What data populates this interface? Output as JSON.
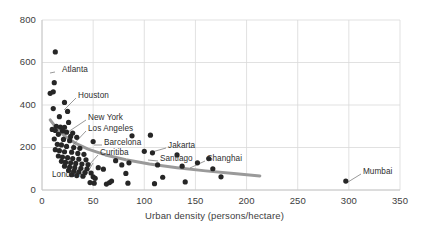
{
  "chart_data": {
    "type": "scatter",
    "title": "",
    "xlabel": "Urban density (persons/hectare)",
    "ylabel": "",
    "xlim": [
      0,
      350
    ],
    "ylim": [
      0,
      800
    ],
    "xticks": [
      0,
      50,
      100,
      150,
      200,
      250,
      300,
      350
    ],
    "yticks": [
      0,
      200,
      400,
      600,
      800
    ],
    "grid": true,
    "legend": "none",
    "marker_color": "#262626",
    "trend_color": "#9a9a9a",
    "grid_color": "#d9d9d9",
    "text_color": "#3d3d3d",
    "points": [
      {
        "x": 13,
        "y": 650
      },
      {
        "x": 12,
        "y": 505
      },
      {
        "x": 8,
        "y": 455
      },
      {
        "x": 11,
        "y": 462
      },
      {
        "x": 22,
        "y": 412
      },
      {
        "x": 11,
        "y": 383
      },
      {
        "x": 25,
        "y": 370
      },
      {
        "x": 17,
        "y": 345
      },
      {
        "x": 26,
        "y": 318
      },
      {
        "x": 14,
        "y": 300
      },
      {
        "x": 18,
        "y": 296
      },
      {
        "x": 22,
        "y": 295
      },
      {
        "x": 10,
        "y": 285
      },
      {
        "x": 13,
        "y": 280
      },
      {
        "x": 20,
        "y": 278
      },
      {
        "x": 24,
        "y": 272
      },
      {
        "x": 30,
        "y": 268
      },
      {
        "x": 16,
        "y": 262
      },
      {
        "x": 28,
        "y": 252
      },
      {
        "x": 34,
        "y": 248
      },
      {
        "x": 12,
        "y": 240
      },
      {
        "x": 21,
        "y": 238
      },
      {
        "x": 27,
        "y": 232
      },
      {
        "x": 88,
        "y": 255
      },
      {
        "x": 106,
        "y": 258
      },
      {
        "x": 50,
        "y": 228
      },
      {
        "x": 15,
        "y": 215
      },
      {
        "x": 19,
        "y": 212
      },
      {
        "x": 24,
        "y": 205
      },
      {
        "x": 31,
        "y": 200
      },
      {
        "x": 37,
        "y": 196
      },
      {
        "x": 13,
        "y": 190
      },
      {
        "x": 17,
        "y": 185
      },
      {
        "x": 22,
        "y": 180
      },
      {
        "x": 29,
        "y": 178
      },
      {
        "x": 35,
        "y": 172
      },
      {
        "x": 41,
        "y": 168
      },
      {
        "x": 16,
        "y": 160
      },
      {
        "x": 20,
        "y": 155
      },
      {
        "x": 25,
        "y": 152
      },
      {
        "x": 30,
        "y": 148
      },
      {
        "x": 36,
        "y": 145
      },
      {
        "x": 43,
        "y": 142
      },
      {
        "x": 19,
        "y": 135
      },
      {
        "x": 23,
        "y": 130
      },
      {
        "x": 28,
        "y": 128
      },
      {
        "x": 33,
        "y": 125
      },
      {
        "x": 39,
        "y": 122
      },
      {
        "x": 45,
        "y": 120
      },
      {
        "x": 22,
        "y": 112
      },
      {
        "x": 27,
        "y": 108
      },
      {
        "x": 32,
        "y": 105
      },
      {
        "x": 38,
        "y": 102
      },
      {
        "x": 44,
        "y": 100
      },
      {
        "x": 26,
        "y": 92
      },
      {
        "x": 31,
        "y": 88
      },
      {
        "x": 36,
        "y": 85
      },
      {
        "x": 42,
        "y": 82
      },
      {
        "x": 48,
        "y": 80
      },
      {
        "x": 29,
        "y": 72
      },
      {
        "x": 34,
        "y": 68
      },
      {
        "x": 40,
        "y": 65
      },
      {
        "x": 50,
        "y": 62
      },
      {
        "x": 55,
        "y": 105
      },
      {
        "x": 60,
        "y": 98
      },
      {
        "x": 72,
        "y": 138
      },
      {
        "x": 78,
        "y": 118
      },
      {
        "x": 85,
        "y": 128
      },
      {
        "x": 82,
        "y": 78
      },
      {
        "x": 100,
        "y": 182
      },
      {
        "x": 108,
        "y": 175
      },
      {
        "x": 113,
        "y": 118
      },
      {
        "x": 118,
        "y": 60
      },
      {
        "x": 132,
        "y": 165
      },
      {
        "x": 137,
        "y": 112
      },
      {
        "x": 140,
        "y": 38
      },
      {
        "x": 152,
        "y": 128
      },
      {
        "x": 163,
        "y": 148
      },
      {
        "x": 167,
        "y": 100
      },
      {
        "x": 175,
        "y": 62
      },
      {
        "x": 47,
        "y": 35
      },
      {
        "x": 51,
        "y": 32
      },
      {
        "x": 52,
        "y": 55
      },
      {
        "x": 63,
        "y": 28
      },
      {
        "x": 66,
        "y": 35
      },
      {
        "x": 68,
        "y": 42
      },
      {
        "x": 84,
        "y": 32
      },
      {
        "x": 110,
        "y": 30
      },
      {
        "x": 297,
        "y": 42
      }
    ],
    "trend": {
      "note": "declining power-law fit",
      "points": [
        {
          "x": 8,
          "y": 330
        },
        {
          "x": 14,
          "y": 292
        },
        {
          "x": 22,
          "y": 255
        },
        {
          "x": 32,
          "y": 222
        },
        {
          "x": 45,
          "y": 192
        },
        {
          "x": 62,
          "y": 165
        },
        {
          "x": 82,
          "y": 142
        },
        {
          "x": 105,
          "y": 122
        },
        {
          "x": 132,
          "y": 105
        },
        {
          "x": 160,
          "y": 90
        },
        {
          "x": 190,
          "y": 76
        },
        {
          "x": 213,
          "y": 66
        }
      ]
    },
    "annotations": [
      {
        "label": "Atlanta",
        "label_x": 62,
        "label_y": 70,
        "tip_x": 55,
        "tip_y": 72,
        "anchor_x": 50,
        "anchor_y": 73
      },
      {
        "label": "Houston",
        "label_x": 78,
        "label_y": 96,
        "tip_x": 76,
        "tip_y": 98,
        "anchor_x": 64,
        "anchor_y": 110
      },
      {
        "label": "New York",
        "label_x": 88,
        "label_y": 118,
        "tip_x": 86,
        "tip_y": 120,
        "anchor_x": 68,
        "anchor_y": 132
      },
      {
        "label": "Los Angeles",
        "label_x": 88,
        "label_y": 129,
        "tip_x": 86,
        "tip_y": 131,
        "anchor_x": 72,
        "anchor_y": 146
      },
      {
        "label": "Barcelona",
        "label_x": 104,
        "label_y": 143,
        "tip_x": 102,
        "tip_y": 145,
        "anchor_x": 94,
        "anchor_y": 145
      },
      {
        "label": "Curitiba",
        "label_x": 100,
        "label_y": 153,
        "tip_x": 98,
        "tip_y": 155,
        "anchor_x": 80,
        "anchor_y": 175
      },
      {
        "label": "Jakarta",
        "label_x": 168,
        "label_y": 146,
        "tip_x": 166,
        "tip_y": 148,
        "anchor_x": 152,
        "anchor_y": 152
      },
      {
        "label": "Santiago",
        "label_x": 160,
        "label_y": 159,
        "tip_x": 158,
        "tip_y": 161,
        "anchor_x": 148,
        "anchor_y": 160
      },
      {
        "label": "Shanghai",
        "label_x": 207,
        "label_y": 159,
        "tip_x": 205,
        "tip_y": 161,
        "anchor_x": 190,
        "anchor_y": 168
      },
      {
        "label": "London",
        "label_x": 52,
        "label_y": 175,
        "tip_x": 85,
        "tip_y": 177,
        "anchor_x": 93,
        "anchor_y": 163
      },
      {
        "label": "Mumbai",
        "label_x": 363,
        "label_y": 172,
        "tip_x": 361,
        "tip_y": 174,
        "anchor_x": 348,
        "anchor_y": 182
      }
    ]
  }
}
